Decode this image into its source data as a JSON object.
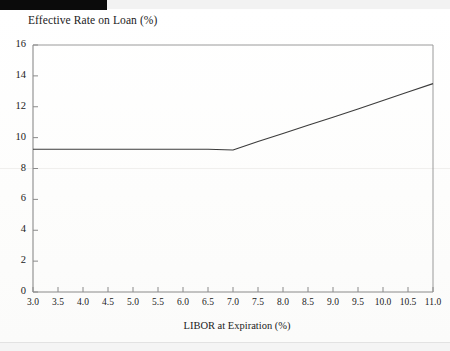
{
  "figure": {
    "title": "Effective Rate on Loan (%)",
    "xlabel": "LIBOR at Expiration (%)",
    "colors": {
      "line": "#3c3c3c",
      "axis": "#8a8a8a",
      "text": "#222222",
      "background": "#ffffff"
    }
  },
  "chart_data": {
    "type": "line",
    "title": "Effective Rate on Loan (%)",
    "xlabel": "LIBOR at Expiration (%)",
    "ylabel": "Effective Rate on Loan (%)",
    "xlim": [
      3.0,
      11.0
    ],
    "ylim": [
      0,
      16
    ],
    "grid": false,
    "legend": "none",
    "xticks": [
      3.0,
      3.5,
      4.0,
      4.5,
      5.0,
      5.5,
      6.0,
      6.5,
      7.0,
      7.5,
      8.0,
      8.5,
      9.0,
      9.5,
      10.0,
      10.5,
      11.0
    ],
    "xticklabels": [
      "3.0",
      "3.5",
      "4.0",
      "4.5",
      "5.0",
      "5.5",
      "6.0",
      "6.5",
      "7.0",
      "7.5",
      "8.0",
      "8.5",
      "9.0",
      "9.5",
      "10.0",
      "10.5",
      "11.0"
    ],
    "yticks": [
      0,
      2,
      4,
      6,
      8,
      10,
      12,
      14,
      16
    ],
    "yticklabels": [
      "0",
      "2",
      "4",
      "6",
      "8",
      "10",
      "12",
      "14",
      "16"
    ],
    "series": [
      {
        "name": "Effective rate on loan",
        "x": [
          3.0,
          3.5,
          4.0,
          4.5,
          5.0,
          5.5,
          6.0,
          6.5,
          7.0,
          7.5,
          8.0,
          8.5,
          9.0,
          9.5,
          10.0,
          10.5,
          11.0
        ],
        "y": [
          9.25,
          9.25,
          9.25,
          9.25,
          9.25,
          9.25,
          9.25,
          9.25,
          9.2,
          9.75,
          10.27,
          10.8,
          11.32,
          11.85,
          12.4,
          12.95,
          13.5
        ],
        "kink_x": 7.0,
        "kink_y": 9.2
      }
    ]
  }
}
